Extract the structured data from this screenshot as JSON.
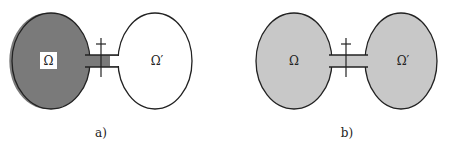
{
  "figure_a": {
    "caption": "a)",
    "left_region_label": "Ω",
    "right_region_label": "Ω′",
    "left_fill": "#7a7a7a",
    "right_fill": "#ffffff",
    "channel_fill": "#7a7a7a"
  },
  "figure_b": {
    "caption": "b)",
    "left_region_label": "Ω",
    "right_region_label": "Ω′",
    "left_fill": "#c8c8c8",
    "right_fill": "#c8c8c8",
    "channel_fill": "#c8c8c8"
  },
  "colors": {
    "stroke": "#222222",
    "label_box": "#ffffff"
  }
}
